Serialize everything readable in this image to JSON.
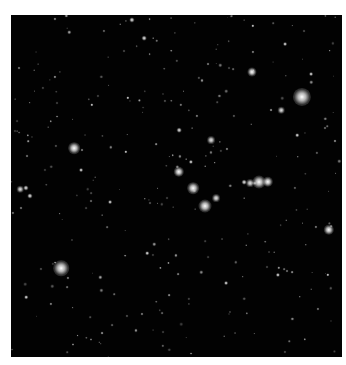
{
  "image": {
    "subject": "star field",
    "background_color": "#020202",
    "frame": {
      "left": 11,
      "top": 15,
      "width": 331,
      "height": 342
    },
    "bright_stars": [
      {
        "x": 302,
        "y": 97,
        "r": 7
      },
      {
        "x": 61,
        "y": 268,
        "r": 6
      },
      {
        "x": 74,
        "y": 148,
        "r": 4.5
      },
      {
        "x": 259,
        "y": 182,
        "r": 5
      },
      {
        "x": 268,
        "y": 182,
        "r": 4
      },
      {
        "x": 250,
        "y": 183,
        "r": 3
      },
      {
        "x": 193,
        "y": 188,
        "r": 4.5
      },
      {
        "x": 205,
        "y": 206,
        "r": 5
      },
      {
        "x": 179,
        "y": 172,
        "r": 4
      },
      {
        "x": 216,
        "y": 198,
        "r": 3
      },
      {
        "x": 211,
        "y": 140,
        "r": 3
      },
      {
        "x": 252,
        "y": 72,
        "r": 3.5
      },
      {
        "x": 329,
        "y": 230,
        "r": 4
      },
      {
        "x": 281,
        "y": 110,
        "r": 2.5
      },
      {
        "x": 20,
        "y": 189,
        "r": 2.5
      },
      {
        "x": 26,
        "y": 188,
        "r": 2
      },
      {
        "x": 30,
        "y": 196,
        "r": 2
      },
      {
        "x": 132,
        "y": 20,
        "r": 2
      },
      {
        "x": 144,
        "y": 38,
        "r": 1.8
      },
      {
        "x": 179,
        "y": 130,
        "r": 1.8
      },
      {
        "x": 191,
        "y": 162,
        "r": 1.6
      },
      {
        "x": 244,
        "y": 182,
        "r": 1.8
      },
      {
        "x": 278,
        "y": 275,
        "r": 1.6
      },
      {
        "x": 110,
        "y": 202,
        "r": 1.5
      },
      {
        "x": 81,
        "y": 170,
        "r": 1.5
      },
      {
        "x": 285,
        "y": 44,
        "r": 1.5
      },
      {
        "x": 311,
        "y": 74,
        "r": 1.5
      },
      {
        "x": 226,
        "y": 283,
        "r": 1.5
      },
      {
        "x": 26,
        "y": 297,
        "r": 1.4
      },
      {
        "x": 147,
        "y": 253,
        "r": 1.4
      },
      {
        "x": 297,
        "y": 135,
        "r": 1.4
      },
      {
        "x": 128,
        "y": 98,
        "r": 1.3
      },
      {
        "x": 126,
        "y": 152,
        "r": 1.3
      },
      {
        "x": 92,
        "y": 105,
        "r": 1.3
      },
      {
        "x": 328,
        "y": 275,
        "r": 1.3
      },
      {
        "x": 253,
        "y": 26,
        "r": 1.3
      }
    ],
    "faint_star_count": 260,
    "faint_star_seed": 7
  }
}
